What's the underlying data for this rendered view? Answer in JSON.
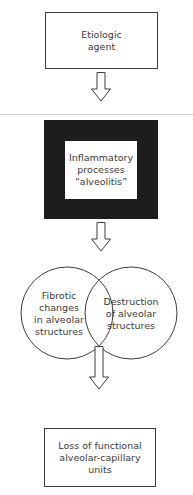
{
  "diagram": {
    "type": "flowchart",
    "direction": "top-to-bottom",
    "nodes": [
      {
        "id": "etiologic",
        "shape": "box",
        "lines": [
          "Etiologic",
          "agent"
        ]
      },
      {
        "id": "inflammatory",
        "shape": "heavy-framed-box",
        "lines": [
          "Inflammatory",
          "processes",
          "“alveolitis”"
        ]
      },
      {
        "id": "fibrotic",
        "shape": "circle",
        "lines": [
          "Fibrotic",
          "changes",
          "in alveolar",
          "structures"
        ]
      },
      {
        "id": "destruction",
        "shape": "circle",
        "lines": [
          "Destruction",
          "of alveolar",
          "structures"
        ]
      },
      {
        "id": "loss",
        "shape": "box",
        "lines": [
          "Loss of functional",
          "alveolar-capillary",
          "units"
        ]
      }
    ],
    "edges": [
      {
        "from": "etiologic",
        "to": "inflammatory",
        "style": "hollow-arrow"
      },
      {
        "from": "inflammatory",
        "to": "fibrotic+destruction",
        "style": "hollow-arrow"
      },
      {
        "from": "fibrotic+destruction",
        "to": "loss",
        "style": "hollow-arrow"
      }
    ],
    "colors": {
      "stroke": "#3c3c3c",
      "frame_fill": "#1d1d1d",
      "divider": "#c9c9c9",
      "text": "#3a3a3a",
      "background": "#ffffff"
    }
  }
}
